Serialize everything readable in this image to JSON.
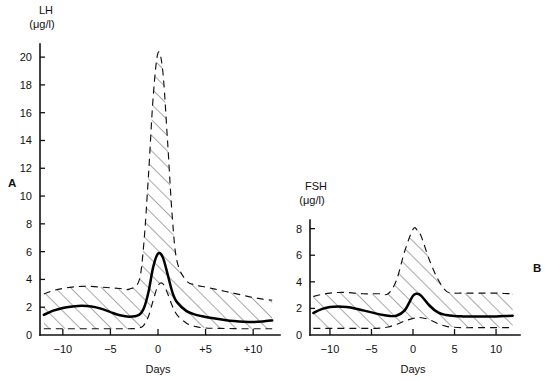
{
  "figure": {
    "background": "#ffffff",
    "line_color": "#111111",
    "mean_color": "#000000",
    "hatch_color": "#5a5a5a"
  },
  "panels": [
    {
      "id": "A",
      "label": "A",
      "label_pos": {
        "x": 8,
        "y": 187
      },
      "plot": {
        "left": 40,
        "right": 276,
        "top": 46,
        "bottom": 335
      },
      "axis_title": {
        "line1": "LH",
        "line2": "(μg/l)",
        "x": 40,
        "y": 14
      },
      "xlabel": "Days",
      "yticks": [
        0,
        2,
        4,
        6,
        8,
        10,
        12,
        14,
        16,
        18,
        20
      ],
      "ytick_labels": [
        "0",
        "2",
        "4",
        "6",
        "8",
        "10",
        "12",
        "14",
        "16",
        "18",
        "20"
      ],
      "ylim": [
        0,
        20.8
      ],
      "xticks": [
        -10,
        -5,
        0,
        5,
        10
      ],
      "xtick_labels": [
        "−10",
        "−5",
        "0",
        "+5",
        "+10"
      ],
      "xlim": [
        -12.4,
        12.4
      ]
    },
    {
      "id": "B",
      "label": "B",
      "label_pos": {
        "x": 533,
        "y": 272
      },
      "plot": {
        "left": 310,
        "right": 516,
        "top": 222,
        "bottom": 335
      },
      "axis_title": {
        "line1": "FSH",
        "line2": "(μg/l)",
        "x": 310,
        "y": 190
      },
      "xlabel": "Days",
      "yticks": [
        0,
        2,
        4,
        6,
        8
      ],
      "ytick_labels": [
        "0",
        "2",
        "4",
        "6",
        "8"
      ],
      "ylim": [
        0,
        8.5
      ],
      "xticks": [
        -10,
        -5,
        0,
        5,
        10
      ],
      "xtick_labels": [
        "−10",
        "−5",
        "0",
        "5",
        "10"
      ],
      "xlim": [
        -12.4,
        12.4
      ]
    }
  ],
  "chart_data": [
    {
      "type": "line",
      "panel": "A",
      "title": "LH",
      "subtitle": "Panel A",
      "xlabel": "Days",
      "ylabel": "LH (μg/l)",
      "xlim": [
        -12.4,
        12.4
      ],
      "ylim": [
        0,
        20.8
      ],
      "grid": false,
      "legend": "none",
      "annotations": [
        "A"
      ],
      "x": [
        -12,
        -11,
        -10,
        -9,
        -8,
        -7,
        -6,
        -5,
        -4,
        -3,
        -2,
        -1.5,
        -1,
        -0.5,
        0,
        0.5,
        1,
        1.5,
        2,
        3,
        4,
        5,
        6,
        7,
        8,
        9,
        10,
        11,
        12
      ],
      "series": [
        {
          "name": "mean",
          "style": "solid",
          "values": [
            1.45,
            1.75,
            1.95,
            2.05,
            2.1,
            2.05,
            1.9,
            1.65,
            1.42,
            1.32,
            1.45,
            1.9,
            3.1,
            4.9,
            5.85,
            5.6,
            4.4,
            3.1,
            2.35,
            1.72,
            1.45,
            1.3,
            1.18,
            1.08,
            1.0,
            0.95,
            0.93,
            0.97,
            1.05
          ]
        },
        {
          "name": "upper_range",
          "style": "dashed",
          "values": [
            2.95,
            3.2,
            3.35,
            3.45,
            3.5,
            3.5,
            3.45,
            3.4,
            3.35,
            3.3,
            3.9,
            6.5,
            11.5,
            17.2,
            20.3,
            19.0,
            14.0,
            8.5,
            5.3,
            3.9,
            3.6,
            3.45,
            3.3,
            3.15,
            3.0,
            2.85,
            2.7,
            2.58,
            2.5
          ]
        },
        {
          "name": "lower_range",
          "style": "dashed",
          "values": [
            0.45,
            0.45,
            0.45,
            0.45,
            0.45,
            0.45,
            0.45,
            0.45,
            0.45,
            0.45,
            0.5,
            0.7,
            1.35,
            2.5,
            3.55,
            3.7,
            3.0,
            2.1,
            1.45,
            0.85,
            0.6,
            0.5,
            0.48,
            0.47,
            0.46,
            0.45,
            0.45,
            0.45,
            0.45
          ]
        }
      ]
    },
    {
      "type": "line",
      "panel": "B",
      "title": "FSH",
      "subtitle": "Panel B",
      "xlabel": "Days",
      "ylabel": "FSH (μg/l)",
      "xlim": [
        -12.4,
        12.4
      ],
      "ylim": [
        0,
        8.5
      ],
      "grid": false,
      "legend": "none",
      "annotations": [
        "B"
      ],
      "x": [
        -12,
        -11,
        -10,
        -9,
        -8,
        -7,
        -6,
        -5,
        -4,
        -3,
        -2,
        -1,
        0,
        0.5,
        1,
        2,
        3,
        4,
        5,
        6,
        7,
        8,
        9,
        10,
        11,
        12
      ],
      "series": [
        {
          "name": "mean",
          "style": "solid",
          "values": [
            1.65,
            1.95,
            2.1,
            2.15,
            2.1,
            2.0,
            1.85,
            1.7,
            1.55,
            1.45,
            1.45,
            1.85,
            2.95,
            3.1,
            2.95,
            2.2,
            1.7,
            1.5,
            1.42,
            1.4,
            1.4,
            1.4,
            1.4,
            1.4,
            1.42,
            1.45
          ]
        },
        {
          "name": "upper_range",
          "style": "dashed",
          "values": [
            2.9,
            3.05,
            3.15,
            3.2,
            3.2,
            3.15,
            3.1,
            3.1,
            3.1,
            3.1,
            4.1,
            6.3,
            7.95,
            7.9,
            7.4,
            5.6,
            4.2,
            3.3,
            3.15,
            3.15,
            3.15,
            3.15,
            3.15,
            3.15,
            3.12,
            3.1
          ]
        },
        {
          "name": "lower_range",
          "style": "dashed",
          "values": [
            0.5,
            0.5,
            0.5,
            0.5,
            0.5,
            0.5,
            0.5,
            0.5,
            0.52,
            0.6,
            0.8,
            1.05,
            1.25,
            1.3,
            1.3,
            1.15,
            0.85,
            0.65,
            0.58,
            0.55,
            0.55,
            0.55,
            0.55,
            0.55,
            0.55,
            0.55
          ]
        }
      ]
    }
  ]
}
